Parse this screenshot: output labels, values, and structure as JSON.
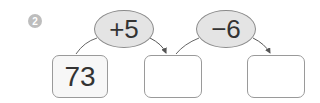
{
  "problem": {
    "number_label": "2",
    "start_value": "73",
    "operations": [
      {
        "label": "+5"
      },
      {
        "label": "−6"
      }
    ],
    "answer_boxes": [
      "",
      ""
    ]
  }
}
